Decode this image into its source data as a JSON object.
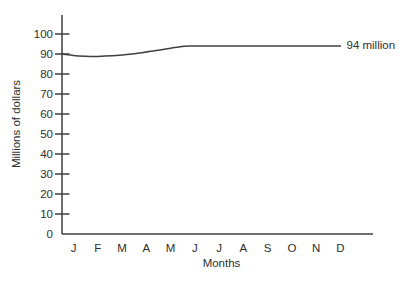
{
  "chart_data": {
    "type": "line",
    "title": "",
    "xlabel": "Months",
    "ylabel": "Millions of dollars",
    "x_tick_labels": [
      "J",
      "F",
      "M",
      "A",
      "M",
      "J",
      "J",
      "A",
      "S",
      "O",
      "N",
      "D"
    ],
    "y_ticks": [
      0,
      10,
      20,
      30,
      40,
      50,
      60,
      70,
      80,
      90,
      100
    ],
    "ylim": [
      0,
      100
    ],
    "grid": false,
    "legend": "none",
    "series": [
      {
        "name": "Millions of dollars",
        "categories": [
          "Jan",
          "Feb",
          "Mar",
          "Apr",
          "May",
          "Jun",
          "Jul",
          "Aug",
          "Sep",
          "Oct",
          "Nov",
          "Dec"
        ],
        "values": [
          89.3,
          88.8,
          89.3,
          90.6,
          92.8,
          94,
          94,
          94,
          94,
          94,
          94,
          94
        ]
      }
    ],
    "curve_points": [
      {
        "month": -0.47,
        "value": 90.0
      },
      {
        "month": 0.0,
        "value": 89.3
      },
      {
        "month": 0.5,
        "value": 88.9
      },
      {
        "month": 1.0,
        "value": 88.8
      },
      {
        "month": 1.6,
        "value": 89.1
      },
      {
        "month": 2.2,
        "value": 89.7
      },
      {
        "month": 2.8,
        "value": 90.6
      },
      {
        "month": 3.4,
        "value": 91.7
      },
      {
        "month": 4.0,
        "value": 92.9
      },
      {
        "month": 4.4,
        "value": 93.6
      },
      {
        "month": 4.8,
        "value": 94.0
      },
      {
        "month": 7.0,
        "value": 94.0
      },
      {
        "month": 11.02,
        "value": 94.0
      }
    ],
    "annotation": {
      "text": "94 million",
      "value": 94
    },
    "colors": {
      "line": "#3f3f3f",
      "axis": "#3f3f3f",
      "text": "#2e2e2e",
      "background": "#ffffff"
    }
  }
}
